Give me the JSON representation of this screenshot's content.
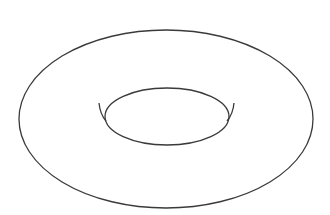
{
  "figure": {
    "background": "#ffffff",
    "stroke_color": "#3a3a3a",
    "stroke_width": 1.3,
    "outer_ellipse": {
      "cx": 166,
      "cy": 119,
      "rx": 147,
      "ry": 89
    },
    "inner_ellipse": {
      "cx": 167,
      "cy": 116.5,
      "rx": 62,
      "ry": 28.5
    },
    "left_cusp_arc": "M 99 103 Q 100 114 106 121",
    "right_cusp_arc": "M 234 103 Q 233 114 227 121"
  }
}
